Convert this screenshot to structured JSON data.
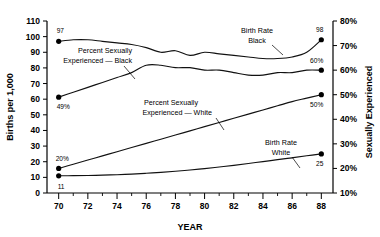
{
  "chart_data": {
    "type": "line",
    "title": "",
    "xlabel": "YEAR",
    "ylabel_left": "Births per 1,000",
    "ylabel_right": "Sexually Experienced",
    "xlim": [
      69.2,
      88.8
    ],
    "xticks_major": [
      70,
      72,
      74,
      76,
      78,
      80,
      82,
      84,
      86,
      88
    ],
    "xticks_major_labels": [
      "70",
      "72",
      "74",
      "76",
      "78",
      "80",
      "82",
      "84",
      "86",
      "88"
    ],
    "xticks_minor": [
      71,
      73,
      75,
      77,
      79,
      81,
      83,
      85,
      87
    ],
    "ylim_left": [
      0,
      110
    ],
    "yticks_left": [
      0,
      10,
      20,
      30,
      40,
      50,
      60,
      70,
      80,
      90,
      100,
      110
    ],
    "yticks_left_labels": [
      "0",
      "10",
      "20",
      "30",
      "40",
      "50",
      "60",
      "70",
      "80",
      "90",
      "100",
      "110"
    ],
    "ylim_right": [
      10,
      80
    ],
    "yticks_right": [
      10,
      20,
      30,
      40,
      50,
      60,
      70,
      80
    ],
    "yticks_right_labels": [
      "10%",
      "20%",
      "30%",
      "40%",
      "50%",
      "60%",
      "70%",
      "80%"
    ],
    "grid": false,
    "legend_position": "inline-annotations",
    "series": [
      {
        "name": "Birth Rate Black",
        "axis": "left",
        "x": [
          70,
          71,
          72,
          73,
          74,
          75,
          76,
          77,
          78,
          79,
          80,
          81,
          82,
          83,
          84,
          85,
          86,
          87,
          88
        ],
        "values": [
          97,
          98,
          98,
          97,
          96,
          95,
          93,
          90,
          91,
          88,
          90,
          89,
          88,
          87,
          86,
          86,
          87,
          90,
          98
        ],
        "start_label": "97",
        "end_label": "98",
        "annotation": "Birth Rate\nBlack"
      },
      {
        "name": "Percent Sexually Experienced — Black",
        "axis": "right",
        "x": [
          70,
          71,
          72,
          73,
          74,
          75,
          76,
          77,
          78,
          79,
          80,
          81,
          82,
          83,
          84,
          85,
          86,
          87,
          88
        ],
        "values": [
          49,
          51,
          53,
          55,
          57,
          59,
          62,
          62,
          61,
          61,
          60,
          60,
          59,
          58,
          58,
          59,
          59,
          60,
          60
        ],
        "start_label": "49%",
        "end_label": "60%",
        "annotation": "Percent Sexually\nExperienced — Black"
      },
      {
        "name": "Percent Sexually Experienced — White",
        "axis": "right",
        "x": [
          70,
          71,
          72,
          73,
          74,
          75,
          76,
          77,
          78,
          79,
          80,
          81,
          82,
          83,
          84,
          85,
          86,
          87,
          88
        ],
        "values": [
          20,
          21.7,
          23.4,
          25.1,
          26.8,
          28.5,
          30.2,
          31.9,
          33.6,
          35.3,
          37,
          38.7,
          40.4,
          42.1,
          43.8,
          45.5,
          47.2,
          48.6,
          50
        ],
        "start_label": "20%",
        "end_label": "50%",
        "annotation": "Percent Sexually\nExperienced — White"
      },
      {
        "name": "Birth Rate White",
        "axis": "left",
        "x": [
          70,
          71,
          72,
          73,
          74,
          75,
          76,
          77,
          78,
          79,
          80,
          81,
          82,
          83,
          84,
          85,
          86,
          87,
          88
        ],
        "values": [
          11,
          11.1,
          11.2,
          11.4,
          11.7,
          12.1,
          12.6,
          13.2,
          13.9,
          14.7,
          15.6,
          16.6,
          17.7,
          18.9,
          20.1,
          21.3,
          22.5,
          23.8,
          25
        ],
        "start_label": "11",
        "end_label": "25",
        "annotation": "Birth Rate\nWhite"
      }
    ],
    "annotations": [
      {
        "id": "ann-se-black",
        "text_line1": "Percent Sexually",
        "text_line2": "Experienced — Black"
      },
      {
        "id": "ann-br-black",
        "text_line1": "Birth Rate",
        "text_line2": "Black"
      },
      {
        "id": "ann-se-white",
        "text_line1": "Percent Sexually",
        "text_line2": "Experienced — White"
      },
      {
        "id": "ann-br-white",
        "text_line1": "Birth Rate",
        "text_line2": "White"
      }
    ],
    "point_labels": {
      "br_black_start": "97",
      "br_black_end": "98",
      "se_black_start": "49%",
      "se_black_end": "60%",
      "se_white_start": "20%",
      "se_white_end": "50%",
      "br_white_start": "11",
      "br_white_end": "25"
    }
  }
}
